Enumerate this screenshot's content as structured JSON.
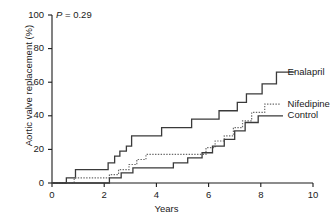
{
  "chart_data": {
    "type": "line",
    "subtype": "kaplan-meier-step",
    "title": "",
    "xlabel": "Years",
    "ylabel": "Aortic valve replacement (%)",
    "xlim": [
      0,
      10
    ],
    "ylim": [
      0,
      100
    ],
    "xticks": [
      0,
      2,
      4,
      6,
      8,
      10
    ],
    "yticks": [
      0,
      20,
      40,
      60,
      80,
      100
    ],
    "xticklabels": [
      "0",
      "2",
      "4",
      "6",
      "8",
      "10"
    ],
    "yticklabels": [
      "0",
      "20",
      "40",
      "60",
      "80",
      "100"
    ],
    "grid": false,
    "legend_position": "right-inline-annotation",
    "annotations": [
      {
        "text": "P = 0.29",
        "x": 0.15,
        "y": 97,
        "italic_prefix": "P"
      }
    ],
    "series": [
      {
        "name": "Enalapril",
        "style": "solid",
        "color": "#3a3a3a",
        "label_x": 8.95,
        "label_y": 66,
        "points": [
          [
            0.0,
            0
          ],
          [
            0.55,
            0
          ],
          [
            0.55,
            3
          ],
          [
            0.9,
            3
          ],
          [
            0.9,
            8
          ],
          [
            2.15,
            8
          ],
          [
            2.15,
            12
          ],
          [
            2.4,
            12
          ],
          [
            2.4,
            16
          ],
          [
            2.6,
            16
          ],
          [
            2.6,
            19
          ],
          [
            2.85,
            19
          ],
          [
            2.85,
            22
          ],
          [
            3.05,
            22
          ],
          [
            3.05,
            28
          ],
          [
            4.2,
            28
          ],
          [
            4.2,
            33
          ],
          [
            5.35,
            33
          ],
          [
            5.35,
            38
          ],
          [
            6.4,
            38
          ],
          [
            6.4,
            43
          ],
          [
            7.1,
            43
          ],
          [
            7.1,
            48
          ],
          [
            7.45,
            48
          ],
          [
            7.45,
            53
          ],
          [
            8.05,
            53
          ],
          [
            8.05,
            59
          ],
          [
            8.6,
            59
          ],
          [
            8.6,
            66
          ],
          [
            9.3,
            66
          ]
        ]
      },
      {
        "name": "Nifedipine",
        "style": "dotted",
        "color": "#6a6a6a",
        "label_x": 8.95,
        "label_y": 47,
        "points": [
          [
            0.0,
            0
          ],
          [
            0.85,
            0
          ],
          [
            0.85,
            3
          ],
          [
            2.2,
            3
          ],
          [
            2.2,
            5
          ],
          [
            2.55,
            5
          ],
          [
            2.55,
            8
          ],
          [
            2.95,
            8
          ],
          [
            2.95,
            11
          ],
          [
            3.25,
            11
          ],
          [
            3.25,
            14
          ],
          [
            3.6,
            14
          ],
          [
            3.6,
            17
          ],
          [
            5.9,
            17
          ],
          [
            5.9,
            21
          ],
          [
            6.25,
            21
          ],
          [
            6.25,
            25
          ],
          [
            6.6,
            25
          ],
          [
            6.6,
            28
          ],
          [
            6.95,
            28
          ],
          [
            6.95,
            33
          ],
          [
            7.3,
            33
          ],
          [
            7.3,
            37
          ],
          [
            7.65,
            37
          ],
          [
            7.65,
            42
          ],
          [
            8.15,
            42
          ],
          [
            8.15,
            47
          ],
          [
            8.75,
            47
          ]
        ]
      },
      {
        "name": "Control",
        "style": "solid",
        "color": "#3a3a3a",
        "label_x": 8.95,
        "label_y": 40,
        "points": [
          [
            0.0,
            0
          ],
          [
            2.2,
            0
          ],
          [
            2.2,
            3
          ],
          [
            2.65,
            3
          ],
          [
            2.65,
            6
          ],
          [
            3.1,
            6
          ],
          [
            3.1,
            9
          ],
          [
            4.65,
            9
          ],
          [
            4.65,
            12
          ],
          [
            5.2,
            12
          ],
          [
            5.2,
            15
          ],
          [
            5.75,
            15
          ],
          [
            5.75,
            18
          ],
          [
            6.15,
            18
          ],
          [
            6.15,
            22
          ],
          [
            6.6,
            22
          ],
          [
            6.6,
            26
          ],
          [
            7.0,
            26
          ],
          [
            7.0,
            31
          ],
          [
            7.4,
            31
          ],
          [
            7.4,
            36
          ],
          [
            7.9,
            36
          ],
          [
            7.9,
            40
          ],
          [
            8.85,
            40
          ]
        ]
      }
    ]
  },
  "axis": {
    "x_title": "Years",
    "y_title": "Aortic valve replacement (%)"
  },
  "pvalue": {
    "prefix": "P",
    "rest": " = 0.29"
  },
  "labels": {
    "enalapril": "Enalapril",
    "nifedipine": "Nifedipine",
    "control": "Control"
  }
}
